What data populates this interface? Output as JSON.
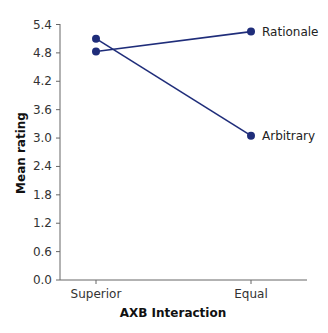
{
  "chart_data": {
    "type": "line",
    "title": "",
    "xlabel": "AXB Interaction",
    "ylabel": "Mean rating",
    "categories": [
      "Superior",
      "Equal"
    ],
    "series": [
      {
        "name": "Rationale",
        "values": [
          4.83,
          5.25
        ]
      },
      {
        "name": "Arbitrary",
        "values": [
          5.1,
          3.05
        ]
      }
    ],
    "ylim": [
      0.0,
      5.4
    ],
    "yticks": [
      "0.0",
      "0.6",
      "1.2",
      "1.8",
      "2.4",
      "3.0",
      "3.6",
      "4.2",
      "4.8",
      "5.4"
    ],
    "grid": false,
    "legend_position": "inline-right",
    "line_color": "#1f2d7a",
    "axis_color": "#555555"
  }
}
